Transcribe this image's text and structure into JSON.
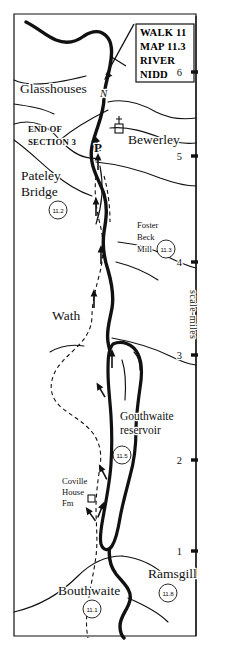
{
  "map": {
    "title_box": {
      "name": "title-box",
      "lines": [
        "WALK 11",
        "MAP 11.3",
        "RIVER",
        "NIDD"
      ]
    },
    "north_arrow": {
      "label": "N"
    },
    "section_note": {
      "line1": "END OF",
      "line2": "SECTION 3"
    },
    "parking_symbol": {
      "label": "P"
    },
    "places": [
      {
        "name": "glasshouses",
        "label": "Glasshouses",
        "x": 20,
        "y": 93,
        "ref": null,
        "size": "lg"
      },
      {
        "name": "bewerley",
        "label": "Bewerley",
        "x": 128,
        "y": 144,
        "ref": null,
        "size": "lg"
      },
      {
        "name": "pateley-bridge",
        "label": "Pateley",
        "label2": "Bridge",
        "x": 21,
        "y": 180,
        "ref": "11.2",
        "size": "lg"
      },
      {
        "name": "wath",
        "label": "Wath",
        "x": 52,
        "y": 320,
        "ref": null,
        "size": "lg"
      },
      {
        "name": "bouthwaite",
        "label": "Bouthwaite",
        "x": 58,
        "y": 595,
        "ref": "11.1",
        "size": "lg"
      },
      {
        "name": "ramsgill",
        "label": "Ramsgill",
        "x": 148,
        "y": 578,
        "ref": "11.8",
        "size": "lg"
      }
    ],
    "features": [
      {
        "name": "foster-beck-mill",
        "lines": [
          "Foster",
          "Beck",
          "Mill"
        ],
        "x": 137,
        "y": 228,
        "ref": "11.3"
      },
      {
        "name": "gouthwaite-reservoir",
        "lines": [
          "Gouthwaite",
          "reservoir"
        ],
        "x": 120,
        "y": 420,
        "ref": "11.5"
      },
      {
        "name": "coville-house-fm",
        "lines": [
          "Coville",
          "House",
          "Fm"
        ],
        "x": 62,
        "y": 480,
        "ref": null
      }
    ],
    "scale": {
      "name": "scale-miles-axis",
      "caption": "scale-miles",
      "ticks": [
        {
          "label": "6",
          "y": 72
        },
        {
          "label": "5",
          "y": 156
        },
        {
          "label": "4",
          "y": 262
        },
        {
          "label": "3",
          "y": 355
        },
        {
          "label": "2",
          "y": 460
        },
        {
          "label": "1",
          "y": 551
        }
      ]
    },
    "colors": {
      "ink": "#111111",
      "paper": "#ffffff"
    }
  }
}
